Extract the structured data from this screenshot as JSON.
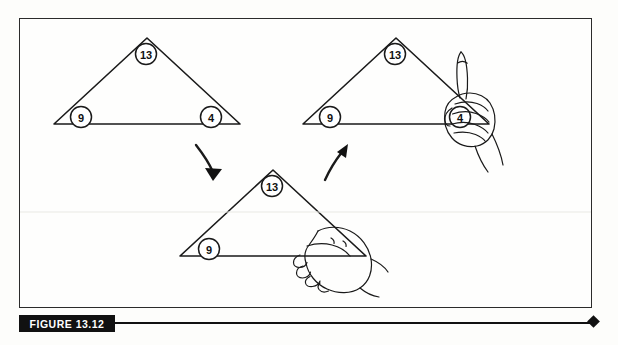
{
  "figure": {
    "caption_label": "FIGURE 13.12",
    "frame_border_color": "#2b2b2b",
    "ink_color": "#1a1a1a",
    "background_color": "#fefefd"
  },
  "diagram": {
    "type": "instructional-sequence",
    "panels": [
      {
        "name": "panel-top-left",
        "stage": 1,
        "angle_labels": [
          "13",
          "9",
          "4"
        ],
        "has_hand": false
      },
      {
        "name": "panel-top-right",
        "stage": 3,
        "angle_labels": [
          "13",
          "9",
          "4"
        ],
        "has_hand": true
      },
      {
        "name": "panel-bottom-center",
        "stage": 2,
        "angle_labels": [
          "13",
          "9"
        ],
        "has_hand": true
      }
    ],
    "arrows": [
      {
        "name": "arrow-step-one",
        "from": "panel-top-left",
        "to": "panel-bottom-center"
      },
      {
        "name": "arrow-step-two",
        "from": "panel-bottom-center",
        "to": "panel-top-right"
      }
    ]
  },
  "labels": {
    "a13": "13",
    "a9": "9",
    "a4": "4",
    "b13": "13",
    "b9": "9",
    "b4": "4",
    "c13": "13",
    "c9": "9"
  }
}
